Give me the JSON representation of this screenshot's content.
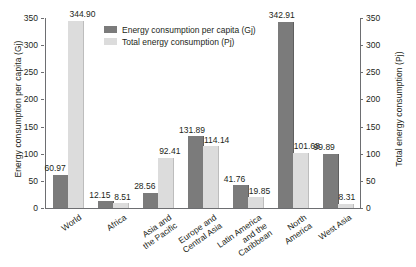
{
  "chart_data": {
    "type": "bar",
    "title": "",
    "xlabel": "",
    "ylabel": "Energy consumption per capita (Gj)",
    "y2label": "Total energy consumption (Pj)",
    "ylim": [
      0,
      350
    ],
    "y2lim": [
      0,
      350
    ],
    "yticks": [
      0,
      50,
      100,
      150,
      200,
      250,
      300,
      350
    ],
    "y2ticks": [
      0,
      50,
      100,
      150,
      200,
      250,
      300,
      350
    ],
    "grid": false,
    "legend_position": "top-center",
    "categories": [
      "World",
      "Africa",
      "Asia and\nthe Pacific",
      "Europe and\nCentral Asia",
      "Latin America\nand the\nCaribbean",
      "North\nAmerica",
      "West Asia"
    ],
    "series": [
      {
        "name": "Energy consumption per capita (Gj)",
        "axis": "left",
        "color": "#7b7b7b",
        "values": [
          60.97,
          12.15,
          28.56,
          131.89,
          41.76,
          342.91,
          99.89
        ],
        "labels": [
          "60.97",
          "12.15",
          "28.56",
          "131.89",
          "41.76",
          "342.91",
          "99.89"
        ]
      },
      {
        "name": "Total energy consumption (Pj)",
        "axis": "right",
        "color": "#dcdcdc",
        "values": [
          344.9,
          8.51,
          92.41,
          114.14,
          19.85,
          101.68,
          8.31
        ],
        "labels": [
          "344.90",
          "8.51",
          "92.41",
          "114.14",
          "19.85",
          "101.68",
          "8.31"
        ]
      }
    ]
  },
  "legend": {
    "items": [
      {
        "label": "Energy consumption per capita (Gj)"
      },
      {
        "label": "Total energy consumption (Pj)"
      }
    ]
  }
}
